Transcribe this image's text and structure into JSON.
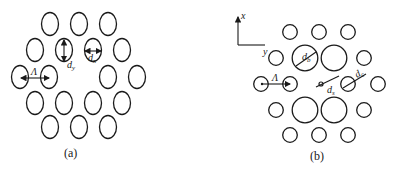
{
  "figure_a": {
    "caption": "(a)",
    "labels": {
      "lattice_pitch": "Λ",
      "diameter_y": "d",
      "diameter_y_sub": "y",
      "diameter_x": "d",
      "diameter_x_sub": "x"
    },
    "holes": [
      [
        50,
        24
      ],
      [
        79,
        24
      ],
      [
        108,
        24
      ],
      [
        35,
        50
      ],
      [
        64,
        50
      ],
      [
        93,
        50
      ],
      [
        122,
        50
      ],
      [
        20,
        77
      ],
      [
        49,
        77
      ],
      [
        108,
        77
      ],
      [
        137,
        77
      ],
      [
        35,
        103
      ],
      [
        64,
        103
      ],
      [
        93,
        103
      ],
      [
        122,
        103
      ],
      [
        50,
        127
      ],
      [
        79,
        127
      ],
      [
        108,
        127
      ]
    ],
    "hole_rx": 8.5,
    "hole_ry": 11.5
  },
  "figure_b": {
    "caption": "(b)",
    "axes": {
      "x": "x",
      "y": "y"
    },
    "labels": {
      "lattice_pitch": "Λ",
      "big_hole": "d",
      "big_hole_sub": "b",
      "core_hole": "d",
      "core_hole_sub": "s",
      "cladding_hole": "d",
      "cladding_hole_sub": "c"
    },
    "small_holes": [
      [
        290,
        32
      ],
      [
        319,
        32
      ],
      [
        348,
        32
      ],
      [
        276,
        58
      ],
      [
        364,
        58
      ],
      [
        261,
        84
      ],
      [
        290,
        84
      ],
      [
        348,
        84
      ],
      [
        378,
        84
      ],
      [
        276,
        110
      ],
      [
        364,
        110
      ],
      [
        290,
        135
      ],
      [
        319,
        135
      ],
      [
        348,
        135
      ]
    ],
    "big_holes": [
      [
        305,
        58
      ],
      [
        334,
        58
      ],
      [
        305,
        110
      ],
      [
        334,
        110
      ]
    ],
    "small_r": 7.3,
    "big_r": 12.8,
    "core_hole": [
      321,
      84
    ]
  }
}
